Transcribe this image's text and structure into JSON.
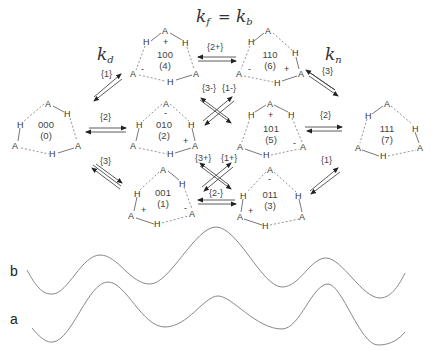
{
  "figure": {
    "equation": {
      "lhs": "k",
      "lhs_sub": "f",
      "eq": " = ",
      "rhs": "k",
      "rhs_sub": "b"
    },
    "rate_labels": {
      "kd": {
        "k": "k",
        "sub": "d"
      },
      "kn": {
        "k": "k",
        "sub": "n"
      }
    },
    "states": [
      {
        "id": "s4",
        "code": "100",
        "index": "(4)"
      },
      {
        "id": "s6",
        "code": "110",
        "index": "(6)"
      },
      {
        "id": "s0",
        "code": "000",
        "index": "(0)"
      },
      {
        "id": "s2",
        "code": "010",
        "index": "(2)"
      },
      {
        "id": "s5",
        "code": "101",
        "index": "(5)"
      },
      {
        "id": "s7",
        "code": "111",
        "index": "(7)"
      },
      {
        "id": "s1",
        "code": "001",
        "index": "(1)"
      },
      {
        "id": "s3",
        "code": "011",
        "index": "(3)"
      }
    ],
    "atoms": {
      "acceptor": "A",
      "hydrogen": "H"
    },
    "charges": {
      "plus": "+",
      "minus": "-"
    },
    "transitions": {
      "t_0_4": "{1}",
      "t_4_6": "{2+}",
      "t_6_7": "{3}",
      "t_0_2": "{2}",
      "t_5_7": "{2}",
      "t_0_1": "{3}",
      "t_3_7": "{1}",
      "t_2_6": "{1-}",
      "t_4_2": "{3-}",
      "t_2_3": "{1+}",
      "t_1_5": "{3+}",
      "t_1_3": "{2-}"
    },
    "traces": {
      "b": "b",
      "a": "a"
    }
  }
}
